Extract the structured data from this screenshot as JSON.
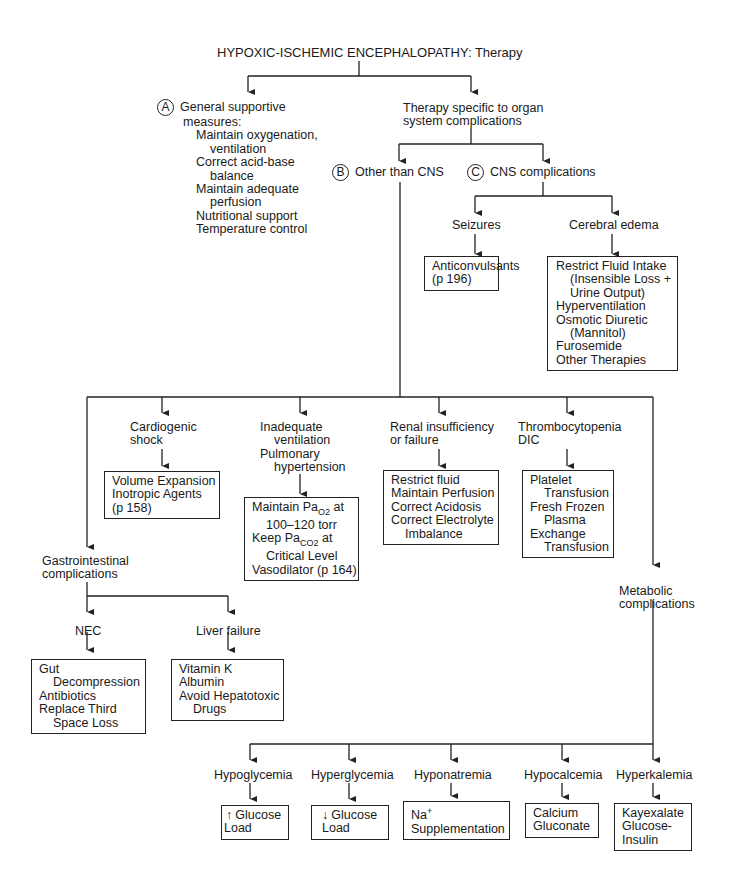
{
  "title": "HYPOXIC-ISCHEMIC ENCEPHALOPATHY: Therapy",
  "branch_a": {
    "marker": "A",
    "heading": [
      "General supportive",
      "measures:"
    ],
    "items": [
      {
        "line": "Maintain oxygenation,",
        "cont": "ventilation"
      },
      {
        "line": "Correct acid-base",
        "cont": "balance"
      },
      {
        "line": "Maintain adequate",
        "cont": "perfusion"
      },
      {
        "line": "Nutritional support"
      },
      {
        "line": "Temperature control"
      }
    ]
  },
  "organ_specific": [
    "Therapy specific to organ",
    "system complications"
  ],
  "branch_b": {
    "marker": "B",
    "label": "Other than CNS"
  },
  "branch_c": {
    "marker": "C",
    "label": "CNS complications",
    "seizures": {
      "label": "Seizures",
      "box": [
        "Anticonvulsants",
        "(p 196)"
      ]
    },
    "cerebral_edema": {
      "label": "Cerebral edema",
      "box": {
        "l1": "Restrict Fluid Intake",
        "l2": "(Insensible Loss +",
        "l3": "Urine Output)",
        "l4": "Hyperventilation",
        "l5": "Osmotic Diuretic",
        "l6": "(Mannitol)",
        "l7": "Furosemide",
        "l8": "Other Therapies"
      }
    }
  },
  "other_than_cns": {
    "cardiogenic": {
      "label": [
        "Cardiogenic",
        "shock"
      ],
      "box": [
        "Volume Expansion",
        "Inotropic Agents",
        "(p 158)"
      ]
    },
    "ventilation": {
      "label": [
        "Inadequate",
        "ventilation",
        "Pulmonary",
        "hypertension"
      ],
      "box": {
        "l1a": "Maintain Pa",
        "l1sub": "O2",
        "l1b": " at",
        "l2": "100–120 torr",
        "l3a": "Keep Pa",
        "l3sub": "CO2",
        "l3b": " at",
        "l4": "Critical Level",
        "l5": "Vasodilator (p 164)"
      }
    },
    "renal": {
      "label": [
        "Renal insufficiency",
        "or failure"
      ],
      "box": [
        "Restrict fluid",
        "Maintain Perfusion",
        "Correct Acidosis",
        "Correct Electrolyte",
        "Imbalance"
      ]
    },
    "thrombo": {
      "label": [
        "Thrombocytopenia",
        "DIC"
      ],
      "box": [
        "Platelet",
        "Transfusion",
        "Fresh Frozen",
        "Plasma",
        "Exchange",
        "Transfusion"
      ]
    },
    "gi": {
      "label": [
        "Gastrointestinal",
        "complications"
      ],
      "nec": {
        "label": "NEC",
        "box": [
          "Gut",
          "Decompression",
          "Antibiotics",
          "Replace Third",
          "Space Loss"
        ]
      },
      "liver": {
        "label": "Liver failure",
        "box": [
          "Vitamin K",
          "Albumin",
          "Avoid Hepatotoxic",
          "Drugs"
        ]
      }
    },
    "metabolic": {
      "label": [
        "Metabolic",
        "complications"
      ],
      "items": [
        {
          "label": "Hypoglycemia",
          "arrow": "↑",
          "box": [
            "Glucose",
            "Load"
          ]
        },
        {
          "label": "Hyperglycemia",
          "arrow": "↓",
          "box": [
            "Glucose",
            "Load"
          ]
        },
        {
          "label": "Hyponatremia",
          "box": [
            "Na",
            "+",
            "Supplementation"
          ]
        },
        {
          "label": "Hypocalcemia",
          "box": [
            "Calcium",
            "Gluconate"
          ]
        },
        {
          "label": "Hyperkalemia",
          "box": [
            "Kayexalate",
            "Glucose-",
            "Insulin"
          ]
        }
      ]
    }
  }
}
